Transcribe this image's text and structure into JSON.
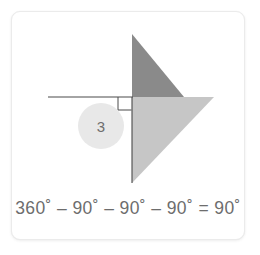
{
  "card": {
    "background_color": "#ffffff",
    "border_color": "#ebebeb"
  },
  "figure": {
    "dark_triangle": {
      "name": "dark-triangle",
      "color": "#8a8a8a",
      "points": "131,33 131,96 183,96"
    },
    "light_triangle": {
      "name": "light-triangle",
      "color": "#c6c6c6",
      "points": "131,96 213,96 131,182"
    },
    "horizontal_ray": {
      "name": "horizontal-ray",
      "color": "#4a4a4a",
      "x1": 47,
      "y1": 96,
      "x2": 132,
      "y2": 96
    },
    "vertical_ray": {
      "name": "vertical-ray",
      "color": "#4a4a4a",
      "x1": 131,
      "y1": 96,
      "x2": 131,
      "y2": 182
    },
    "right_angle_marker": {
      "name": "right-angle-marker",
      "color": "#4a4a4a",
      "points": "117,96 117,109 130,109"
    },
    "badge": {
      "name": "step-badge",
      "label": "3",
      "fill": "#e8e8e8",
      "text_color": "#6e6e6e",
      "cx": 100,
      "cy": 125,
      "r": 23
    }
  },
  "equation": {
    "text": "360˚ – 90˚ – 90˚ – 90˚ = 90˚",
    "color": "#6d6d6d",
    "terms": [
      "360˚",
      "90˚",
      "90˚",
      "90˚"
    ],
    "result": "90˚",
    "operators": [
      "–",
      "–",
      "–",
      "="
    ]
  }
}
